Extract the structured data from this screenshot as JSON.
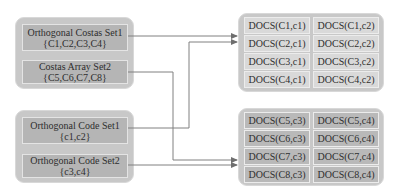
{
  "left_groups": [
    {
      "name": "costas-sets",
      "items": [
        {
          "title": "Orthogonal Costas Set1",
          "members": "{C1,C2,C3,C4}"
        },
        {
          "title": "Costas Array Set2",
          "members": "{C5,C6,C7,C8}"
        }
      ]
    },
    {
      "name": "code-sets",
      "items": [
        {
          "title": "Orthogonal Code Set1",
          "members": "{c1,c2}"
        },
        {
          "title": "Orthogonal Code Set2",
          "members": "{c3,c4}"
        }
      ]
    }
  ],
  "right_groups": [
    {
      "name": "docs-group-1",
      "rows": [
        [
          "DOCS(C1,c1)",
          "DOCS(C1,c2)"
        ],
        [
          "DOCS(C2,c1)",
          "DOCS(C2,c2)"
        ],
        [
          "DOCS(C3,c1)",
          "DOCS(C3,c2)"
        ],
        [
          "DOCS(C4,c1)",
          "DOCS(C4,c2)"
        ]
      ]
    },
    {
      "name": "docs-group-2",
      "rows": [
        [
          "DOCS(C5,c3)",
          "DOCS(C5,c4)"
        ],
        [
          "DOCS(C6,c3)",
          "DOCS(C6,c4)"
        ],
        [
          "DOCS(C7,c3)",
          "DOCS(C7,c4)"
        ],
        [
          "DOCS(C8,c3)",
          "DOCS(C8,c4)"
        ]
      ]
    }
  ],
  "connections": [
    {
      "from": "Orthogonal Costas Set1",
      "to": "docs-group-1"
    },
    {
      "from": "Orthogonal Code Set1",
      "to": "docs-group-1"
    },
    {
      "from": "Costas Array Set2",
      "to": "docs-group-2"
    },
    {
      "from": "Orthogonal Code Set2",
      "to": "docs-group-2"
    }
  ],
  "colors": {
    "group_bg": "#c8c8c8",
    "left_cell_bg": "#b5b5b5",
    "right_cell_light": "#d9d9d9",
    "right_cell_dark": "#b9b9b9",
    "line": "#7a7a7a"
  }
}
